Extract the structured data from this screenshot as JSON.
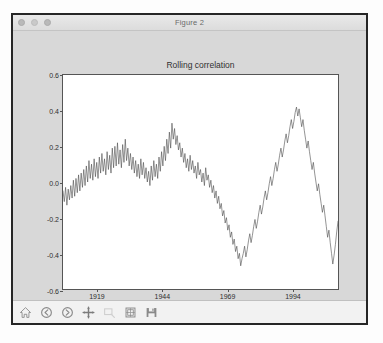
{
  "window": {
    "title": "Figure 2",
    "controls": [
      {
        "name": "close-button",
        "color": "#b9b9b9"
      },
      {
        "name": "minimize-button",
        "color": "#c9c9c9"
      },
      {
        "name": "zoom-button",
        "color": "#b9b9b9"
      }
    ]
  },
  "toolbar": {
    "buttons": [
      {
        "name": "home-button",
        "icon": "home-icon",
        "label": "Reset original view",
        "enabled": true
      },
      {
        "name": "back-button",
        "icon": "back-arrow-icon",
        "label": "Back to previous view",
        "enabled": true
      },
      {
        "name": "forward-button",
        "icon": "forward-arrow-icon",
        "label": "Forward to next view",
        "enabled": true
      },
      {
        "name": "pan-button",
        "icon": "pan-move-icon",
        "label": "Pan axes with left mouse, zoom with right",
        "enabled": true
      },
      {
        "name": "zoom-rect-button",
        "icon": "zoom-rect-icon",
        "label": "Zoom to rectangle",
        "enabled": false
      },
      {
        "name": "configure-subplots-button",
        "icon": "subplots-icon",
        "label": "Configure subplots",
        "enabled": true
      },
      {
        "name": "save-button",
        "icon": "floppy-save-icon",
        "label": "Save the figure",
        "enabled": true
      }
    ]
  },
  "chart_data": {
    "type": "line",
    "title": "Rolling correlation",
    "xlabel": "",
    "ylabel": "",
    "xlim": [
      1906,
      2012
    ],
    "ylim": [
      -0.6,
      0.6
    ],
    "grid": false,
    "legend": false,
    "xticks": [
      1919,
      1944,
      1969,
      1994
    ],
    "xtick_labels": [
      "1919",
      "1944",
      "1969",
      "1994"
    ],
    "yticks": [
      0.6,
      0.4,
      0.2,
      0.0,
      -0.2,
      -0.4,
      -0.6
    ],
    "ytick_labels": [
      "0.6",
      "0.4",
      "0.2",
      "0.0",
      "-0.2",
      "-0.4",
      "-0.6"
    ],
    "line_color": "#4a4a4a",
    "line_width": 0.6,
    "series": [
      {
        "name": "rolling correlation",
        "x": [
          1906.0,
          1906.5,
          1907.0,
          1907.5,
          1908.0,
          1908.5,
          1909.0,
          1909.5,
          1910.0,
          1910.5,
          1911.0,
          1911.5,
          1912.0,
          1912.5,
          1913.0,
          1913.5,
          1914.0,
          1914.5,
          1915.0,
          1915.5,
          1916.0,
          1916.5,
          1917.0,
          1917.5,
          1918.0,
          1918.5,
          1919.0,
          1919.5,
          1920.0,
          1920.5,
          1921.0,
          1921.5,
          1922.0,
          1922.5,
          1923.0,
          1923.5,
          1924.0,
          1924.5,
          1925.0,
          1925.5,
          1926.0,
          1926.5,
          1927.0,
          1927.5,
          1928.0,
          1928.5,
          1929.0,
          1929.5,
          1930.0,
          1930.5,
          1931.0,
          1931.5,
          1932.0,
          1932.5,
          1933.0,
          1933.5,
          1934.0,
          1934.5,
          1935.0,
          1935.5,
          1936.0,
          1936.5,
          1937.0,
          1937.5,
          1938.0,
          1938.5,
          1939.0,
          1939.5,
          1940.0,
          1940.5,
          1941.0,
          1941.5,
          1942.0,
          1942.5,
          1943.0,
          1943.5,
          1944.0,
          1944.5,
          1945.0,
          1945.5,
          1946.0,
          1946.5,
          1947.0,
          1947.5,
          1948.0,
          1948.5,
          1949.0,
          1949.5,
          1950.0,
          1950.5,
          1951.0,
          1951.5,
          1952.0,
          1952.5,
          1953.0,
          1953.5,
          1954.0,
          1954.5,
          1955.0,
          1955.5,
          1956.0,
          1956.5,
          1957.0,
          1957.5,
          1958.0,
          1958.5,
          1959.0,
          1959.5,
          1960.0,
          1960.5,
          1961.0,
          1961.5,
          1962.0,
          1962.5,
          1963.0,
          1963.5,
          1964.0,
          1964.5,
          1965.0,
          1965.5,
          1966.0,
          1966.5,
          1967.0,
          1967.5,
          1968.0,
          1968.5,
          1969.0,
          1969.5,
          1970.0,
          1970.5,
          1971.0,
          1971.5,
          1972.0,
          1972.5,
          1973.0,
          1973.5,
          1974.0,
          1974.5,
          1975.0,
          1975.5,
          1976.0,
          1976.5,
          1977.0,
          1977.5,
          1978.0,
          1978.5,
          1979.0,
          1979.5,
          1980.0,
          1980.5,
          1981.0,
          1981.5,
          1982.0,
          1982.5,
          1983.0,
          1983.5,
          1984.0,
          1984.5,
          1985.0,
          1985.5,
          1986.0,
          1986.5,
          1987.0,
          1987.5,
          1988.0,
          1988.5,
          1989.0,
          1989.5,
          1990.0,
          1990.5,
          1991.0,
          1991.5,
          1992.0,
          1992.5,
          1993.0,
          1993.5,
          1994.0,
          1994.5,
          1995.0,
          1995.5,
          1996.0,
          1996.5,
          1997.0,
          1997.5,
          1998.0,
          1998.5,
          1999.0,
          1999.5,
          2000.0,
          2000.5,
          2001.0,
          2001.5,
          2002.0,
          2002.5,
          2003.0,
          2003.5,
          2004.0,
          2004.5,
          2005.0,
          2005.5,
          2006.0,
          2006.5,
          2007.0,
          2007.5,
          2008.0,
          2008.5,
          2009.0,
          2009.5,
          2010.0,
          2010.5,
          2011.0,
          2011.5,
          2012.0
        ],
        "y": [
          -0.05,
          -0.11,
          -0.03,
          -0.13,
          -0.04,
          -0.1,
          -0.02,
          -0.09,
          0.01,
          -0.08,
          0.02,
          -0.06,
          0.04,
          -0.05,
          0.05,
          -0.03,
          0.07,
          -0.02,
          0.09,
          0.0,
          0.12,
          0.02,
          0.1,
          0.01,
          0.13,
          0.03,
          0.11,
          0.02,
          0.14,
          0.05,
          0.16,
          0.06,
          0.13,
          0.04,
          0.17,
          0.07,
          0.15,
          0.05,
          0.19,
          0.08,
          0.2,
          0.09,
          0.22,
          0.1,
          0.18,
          0.08,
          0.21,
          0.11,
          0.24,
          0.12,
          0.19,
          0.09,
          0.16,
          0.07,
          0.14,
          0.05,
          0.12,
          0.03,
          0.1,
          0.02,
          0.13,
          0.04,
          0.11,
          0.02,
          0.08,
          0.0,
          0.06,
          -0.02,
          0.09,
          0.01,
          0.12,
          0.03,
          0.1,
          0.02,
          0.14,
          0.06,
          0.17,
          0.09,
          0.2,
          0.12,
          0.24,
          0.16,
          0.28,
          0.19,
          0.33,
          0.24,
          0.3,
          0.21,
          0.26,
          0.18,
          0.22,
          0.14,
          0.19,
          0.11,
          0.16,
          0.08,
          0.13,
          0.06,
          0.15,
          0.07,
          0.12,
          0.05,
          0.09,
          0.02,
          0.11,
          0.04,
          0.07,
          0.0,
          0.05,
          -0.02,
          0.08,
          0.01,
          0.04,
          -0.03,
          0.01,
          -0.06,
          -0.02,
          -0.09,
          -0.05,
          -0.12,
          -0.08,
          -0.15,
          -0.12,
          -0.19,
          -0.16,
          -0.23,
          -0.2,
          -0.27,
          -0.24,
          -0.31,
          -0.28,
          -0.35,
          -0.32,
          -0.39,
          -0.36,
          -0.43,
          -0.4,
          -0.47,
          -0.43,
          -0.4,
          -0.36,
          -0.42,
          -0.38,
          -0.33,
          -0.29,
          -0.34,
          -0.3,
          -0.25,
          -0.21,
          -0.26,
          -0.22,
          -0.17,
          -0.13,
          -0.18,
          -0.14,
          -0.09,
          -0.05,
          -0.1,
          -0.06,
          -0.01,
          0.03,
          -0.02,
          0.02,
          0.07,
          0.11,
          0.06,
          0.1,
          0.15,
          0.19,
          0.14,
          0.18,
          0.23,
          0.27,
          0.22,
          0.26,
          0.31,
          0.35,
          0.3,
          0.34,
          0.39,
          0.42,
          0.37,
          0.41,
          0.36,
          0.31,
          0.35,
          0.29,
          0.24,
          0.19,
          0.23,
          0.17,
          0.12,
          0.07,
          0.11,
          0.05,
          0.0,
          -0.05,
          -0.01,
          -0.07,
          -0.12,
          -0.17,
          -0.13,
          -0.19,
          -0.25,
          -0.31,
          -0.27,
          -0.34,
          -0.4,
          -0.46,
          -0.41,
          -0.35,
          -0.28,
          -0.22
        ]
      }
    ]
  }
}
